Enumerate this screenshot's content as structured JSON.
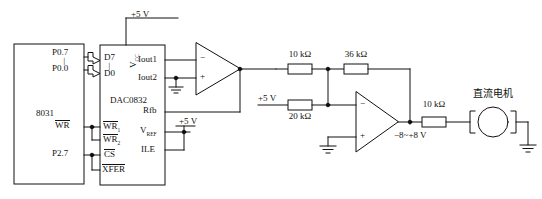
{
  "diagram": {
    "power_top": "+5 V",
    "mcu": {
      "name": "8031",
      "pins": {
        "p07": "P0.7",
        "p00": "P0.0",
        "ellipsis": "│",
        "wr": "WR",
        "p27": "P2.7"
      }
    },
    "dac": {
      "name": "DAC0832",
      "pins": {
        "d7": "D7",
        "d0": "D0",
        "ellipsis": "│",
        "vcc": "V",
        "vcc_sub": "CC",
        "iout1": "Iout1",
        "iout2": "Iout2",
        "rfb": "Rfb",
        "vref": "V",
        "vref_sub": "REF",
        "ile": "ILE",
        "wr1": "WR",
        "wr1_sub": "1",
        "wr2": "WR",
        "wr2_sub": "2",
        "cs": "CS",
        "xfer": "XFER"
      },
      "vref_supply": "+5 V"
    },
    "opamp1": {
      "minus": "−",
      "plus": "+"
    },
    "opamp2": {
      "minus": "−",
      "plus": "+"
    },
    "resistors": {
      "r1": "10 kΩ",
      "r2": "36 kΩ",
      "r3": "20 kΩ",
      "r4": "10 kΩ"
    },
    "bias_supply": "+5 V",
    "output_range": "−8~+8 V",
    "motor": {
      "label": "直流电机"
    },
    "colors": {
      "line": "#111111",
      "background": "#ffffff"
    }
  }
}
